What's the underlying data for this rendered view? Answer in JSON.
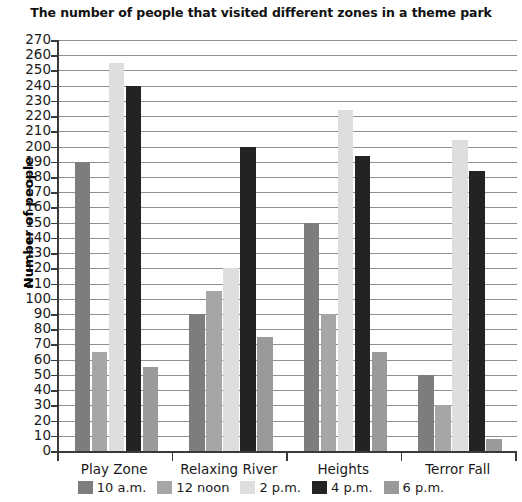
{
  "chart_data": {
    "type": "bar",
    "title": "The number of people that visited different zones in a theme park",
    "xlabel": "",
    "ylabel": "Number of people",
    "ylim": [
      0,
      270
    ],
    "ytick_step": 10,
    "yticks": [
      270,
      260,
      250,
      240,
      230,
      220,
      210,
      200,
      190,
      180,
      170,
      160,
      150,
      140,
      130,
      120,
      110,
      100,
      90,
      80,
      70,
      60,
      50,
      40,
      30,
      20,
      10,
      0
    ],
    "grid": true,
    "legend_position": "bottom",
    "categories": [
      "Play Zone",
      "Relaxing River",
      "Heights",
      "Terror Fall"
    ],
    "series": [
      {
        "name": "10 a.m.",
        "color": "#7d7d7d",
        "values": [
          190,
          90,
          150,
          50
        ]
      },
      {
        "name": "12 noon",
        "color": "#a6a6a6",
        "values": [
          65,
          105,
          90,
          30
        ]
      },
      {
        "name": "2 p.m.",
        "color": "#dedede",
        "values": [
          255,
          120,
          224,
          204
        ]
      },
      {
        "name": "4 p.m.",
        "color": "#232323",
        "values": [
          240,
          200,
          194,
          184
        ]
      },
      {
        "name": "6 p.m.",
        "color": "#9a9a9a",
        "values": [
          55,
          75,
          65,
          8
        ]
      }
    ]
  },
  "axis_colors": {
    "axis_line": "#3a3a3a",
    "gridline": "#8f8f8f",
    "background": "#ffffff"
  }
}
